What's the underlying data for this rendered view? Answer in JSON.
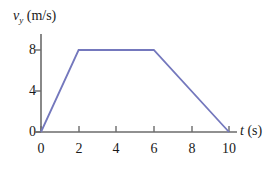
{
  "chart_data": {
    "type": "line",
    "title": "",
    "subtitle": "",
    "xlabel": "t (s)",
    "ylabel": "v_y (m/s)",
    "xlabel_parts": {
      "variable": "t",
      "unit": "(s)"
    },
    "ylabel_parts": {
      "variable": "v",
      "subscript": "y",
      "unit": "(m/s)"
    },
    "x": [
      0,
      2,
      6,
      10
    ],
    "values": [
      0,
      8,
      8,
      0
    ],
    "series": [
      {
        "name": "v_y",
        "points": [
          {
            "x": 0,
            "y": 0
          },
          {
            "x": 2,
            "y": 8
          },
          {
            "x": 6,
            "y": 8
          },
          {
            "x": 10,
            "y": 0
          }
        ]
      }
    ],
    "xlim": [
      0,
      10
    ],
    "ylim": [
      0,
      9
    ],
    "xticks": [
      0,
      2,
      4,
      6,
      8,
      10
    ],
    "yticks": [
      0,
      4,
      8
    ],
    "xtick_labels": [
      "0",
      "2",
      "4",
      "6",
      "8",
      "10"
    ],
    "ytick_labels": [
      "0",
      "4",
      "8"
    ],
    "grid": false,
    "legend": false,
    "legend_position": "none",
    "annotations": []
  },
  "style": {
    "line_color": "#7478bd",
    "axis_color": "#6b6b6b",
    "text_color": "#1a1a1a",
    "background_color": "#ffffff"
  }
}
